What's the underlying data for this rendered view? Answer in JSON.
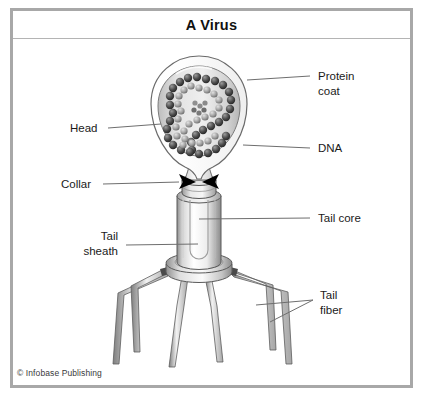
{
  "figure": {
    "title": "A Virus",
    "credit": "© Infobase Publishing",
    "frame_color": "#a8a8a8",
    "line_color": "#6e6e6e",
    "text_color": "#1a1a1a",
    "background": "#ffffff"
  },
  "labels": {
    "protein_coat": {
      "line1": "Protein",
      "line2": "coat",
      "side": "right"
    },
    "dna": {
      "line1": "DNA",
      "side": "right"
    },
    "tail_core": {
      "line1": "Tail core",
      "side": "right"
    },
    "tail_fiber": {
      "line1": "Tail",
      "line2": "fiber",
      "side": "right"
    },
    "head": {
      "line1": "Head",
      "side": "left"
    },
    "collar": {
      "line1": "Collar",
      "side": "left"
    },
    "tail_sheath": {
      "line1": "Tail",
      "line2": "sheath",
      "side": "left"
    }
  },
  "structures": {
    "capsid": "protein-coat-hexagonal-capsid",
    "genome": "coiled-dna-strand-beads",
    "collar": "collar-ring-with-arrowheads",
    "sheath": "contractile-tail-sheath-cylinder",
    "baseplate": "baseplate-ring",
    "fibers_count": 6
  }
}
